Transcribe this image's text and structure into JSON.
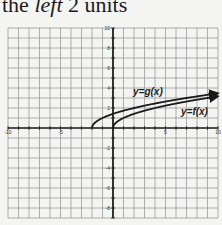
{
  "caption": {
    "pre": "the ",
    "italic": "left",
    "post": " 2 units"
  },
  "chart_data": {
    "type": "line",
    "title": "",
    "xlabel": "",
    "ylabel": "",
    "xlim": [
      -10,
      10
    ],
    "ylim": [
      -9,
      10
    ],
    "grid": true,
    "x_ticks": [
      -10,
      -5,
      5,
      10
    ],
    "y_ticks": [
      10,
      8,
      6,
      4,
      2,
      -2,
      -4,
      -6,
      -8
    ],
    "series": [
      {
        "name": "y=g(x)",
        "formula": "sqrt(x+2)",
        "x": [
          -2,
          -1,
          0,
          2,
          5,
          7,
          10
        ],
        "values": [
          0,
          1,
          1.41,
          2,
          2.65,
          3,
          3.46
        ]
      },
      {
        "name": "y=f(x)",
        "formula": "sqrt(x)",
        "x": [
          0,
          1,
          2,
          4,
          6,
          9,
          10
        ],
        "values": [
          0,
          1,
          1.41,
          2,
          2.45,
          3,
          3.16
        ]
      }
    ],
    "annotations": [
      "y=g(x)",
      "y=f(x)"
    ]
  }
}
